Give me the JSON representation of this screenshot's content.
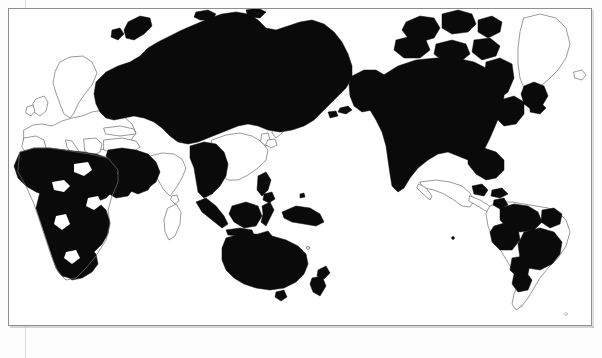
{
  "document": {
    "type": "world-map",
    "projection": "pacific-centered-cylindrical",
    "background_color": "#ffffff",
    "frame_color": "#8e8e8e",
    "fill_color": "#0a0a0a",
    "coast_color": "#6f6f6f",
    "title": "",
    "caption": "",
    "legend": []
  },
  "map_data": {
    "type": "choropleth",
    "note": "Binary shaded world map: highlighted territories rendered solid black, all other land left white with outline only.",
    "regions_filled": [
      {
        "name": "Russia / Northern Asia",
        "state": "filled"
      },
      {
        "name": "Central Asia",
        "state": "filled"
      },
      {
        "name": "Mongolia",
        "state": "filled"
      },
      {
        "name": "Middle East",
        "state": "filled"
      },
      {
        "name": "Africa (most)",
        "state": "filled"
      },
      {
        "name": "Southeast Asia mainland",
        "state": "filled"
      },
      {
        "name": "Indonesia",
        "state": "filled"
      },
      {
        "name": "Philippines",
        "state": "filled"
      },
      {
        "name": "Papua New Guinea",
        "state": "filled"
      },
      {
        "name": "Australia",
        "state": "filled"
      },
      {
        "name": "New Zealand",
        "state": "filled"
      },
      {
        "name": "Alaska",
        "state": "filled"
      },
      {
        "name": "Canada",
        "state": "filled"
      },
      {
        "name": "Canadian Arctic Archipelago",
        "state": "filled"
      },
      {
        "name": "United States (contiguous)",
        "state": "filled"
      },
      {
        "name": "Greenland (southern tip)",
        "state": "filled"
      },
      {
        "name": "Central America (part)",
        "state": "filled"
      },
      {
        "name": "Colombia / Venezuela",
        "state": "filled"
      },
      {
        "name": "Brazil (interior)",
        "state": "filled"
      },
      {
        "name": "Paraguay / Northern Argentina",
        "state": "filled"
      }
    ],
    "regions_unfilled": [
      {
        "name": "Europe",
        "state": "unfilled"
      },
      {
        "name": "Scandinavia",
        "state": "unfilled"
      },
      {
        "name": "British Isles",
        "state": "unfilled"
      },
      {
        "name": "India",
        "state": "unfilled"
      },
      {
        "name": "China (east)",
        "state": "unfilled"
      },
      {
        "name": "Japan",
        "state": "unfilled"
      },
      {
        "name": "Korea",
        "state": "unfilled"
      },
      {
        "name": "Mexico",
        "state": "unfilled"
      },
      {
        "name": "Madagascar",
        "state": "unfilled"
      },
      {
        "name": "Greenland (main)",
        "state": "unfilled"
      },
      {
        "name": "Chile",
        "state": "unfilled"
      },
      {
        "name": "Southern Argentina",
        "state": "unfilled"
      }
    ]
  }
}
